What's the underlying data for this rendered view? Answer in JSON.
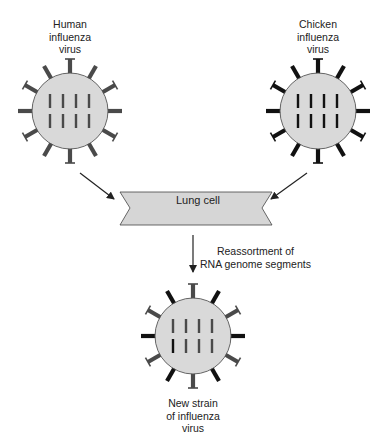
{
  "diagram": {
    "colors": {
      "virus_body": "#d9d9d9",
      "virus_outline": "#555555",
      "human_component": "#4a4a4a",
      "chicken_component": "#111111",
      "banner_fill": "#d6d6d6",
      "arrow": "#222222"
    },
    "nodes": [
      {
        "id": "human",
        "label_lines": [
          "Human",
          "influenza",
          "virus"
        ],
        "spikes": "all-gray",
        "segments": "all-gray"
      },
      {
        "id": "chicken",
        "label_lines": [
          "Chicken",
          "influenza",
          "virus"
        ],
        "spikes": "all-black",
        "segments": "all-black"
      },
      {
        "id": "lung-cell",
        "label": "Lung cell"
      },
      {
        "id": "new-strain",
        "label_lines": [
          "New strain",
          "of influenza",
          "virus"
        ],
        "spikes": "mixed: T-shaped gray, plain black",
        "segments": "mixed: one black, seven gray"
      }
    ],
    "edges": [
      {
        "from": "human",
        "to": "lung-cell",
        "label": ""
      },
      {
        "from": "chicken",
        "to": "lung-cell",
        "label": ""
      },
      {
        "from": "lung-cell",
        "to": "new-strain",
        "label_lines": [
          "Reassortment of",
          "RNA genome segments"
        ]
      }
    ]
  },
  "labels": {
    "human": [
      "Human",
      "influenza",
      "virus"
    ],
    "chicken": [
      "Chicken",
      "influenza",
      "virus"
    ],
    "lung_cell": "Lung cell",
    "reassortment": [
      "Reassortment of",
      "RNA genome segments"
    ],
    "new_strain": [
      "New strain",
      "of influenza",
      "virus"
    ]
  }
}
